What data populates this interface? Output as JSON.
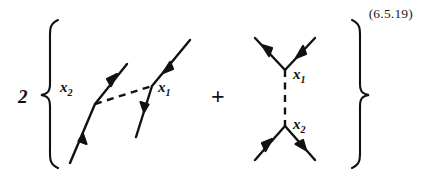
{
  "equation": {
    "number": "(6.5.19)",
    "coefficient": "2",
    "operator": "+",
    "left_brace": "{",
    "right_brace": "}"
  },
  "diagrams": [
    {
      "name": "exchange-diagram",
      "description": "two fermion lines connected by a dashed boson exchange line",
      "vertex_labels": [
        {
          "name": "x2-label",
          "text": "x",
          "sub": "2"
        },
        {
          "name": "x1-label",
          "text": "x",
          "sub": "1"
        }
      ],
      "lines": [
        {
          "name": "left-fermion-line",
          "style": "solid",
          "arrows": 2,
          "direction": "upward"
        },
        {
          "name": "right-fermion-line",
          "style": "solid",
          "arrows": 2,
          "direction": "downward"
        },
        {
          "name": "boson-exchange-line",
          "style": "dashed",
          "arrows": 0
        }
      ]
    },
    {
      "name": "annihilation-diagram",
      "description": "two vertices joined by a vertical dashed propagator, each with an open V of fermion legs",
      "vertex_labels": [
        {
          "name": "x1-label",
          "text": "x",
          "sub": "1"
        },
        {
          "name": "x2-label",
          "text": "x",
          "sub": "2"
        }
      ],
      "lines": [
        {
          "name": "top-left-leg",
          "style": "solid",
          "arrows": 1,
          "direction": "outgoing"
        },
        {
          "name": "top-right-leg",
          "style": "solid",
          "arrows": 1,
          "direction": "incoming"
        },
        {
          "name": "vertical-propagator",
          "style": "dashed",
          "arrows": 0
        },
        {
          "name": "bottom-left-leg",
          "style": "solid",
          "arrows": 1,
          "direction": "incoming"
        },
        {
          "name": "bottom-right-leg",
          "style": "solid",
          "arrows": 1,
          "direction": "outgoing"
        }
      ]
    }
  ],
  "colors": {
    "ink": "#111111",
    "text": "#1a1a1a",
    "background": "#ffffff"
  }
}
